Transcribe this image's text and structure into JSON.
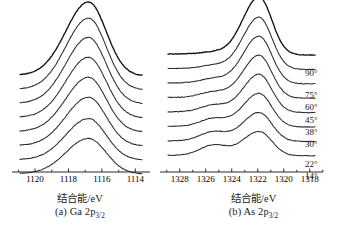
{
  "figure": {
    "type": "angle-resolved-xps-spectra",
    "panels": [
      {
        "id": "a",
        "label": "(a) Ga 2p",
        "label_sub": "3/2",
        "axis_unit": "结合能/eV",
        "ticks": [
          1120,
          1118,
          1116,
          1114
        ],
        "tick_labels": [
          "1120",
          "1118",
          "1116",
          "1114"
        ],
        "xlim": [
          1120.9,
          1113.6
        ],
        "peak_center": 1116.8,
        "peak_width": 1.15
      },
      {
        "id": "b",
        "label": "(b) As 2p",
        "label_sub": "3/2",
        "axis_unit": "结合能/eV",
        "ticks": [
          1328,
          1326,
          1324,
          1322,
          1320,
          1318
        ],
        "tick_labels": [
          "1328",
          "1326",
          "1324",
          "1322",
          "1320",
          "1318"
        ],
        "xlim": [
          1328.9,
          1317.6
        ],
        "peak_center": 1321.9,
        "peak_width": 1.05,
        "oxide_center": 1325.4,
        "oxide_width": 0.95
      }
    ],
    "angles": [
      "90°",
      "75°",
      "60°",
      "45°",
      "38°",
      "30°",
      "22°",
      "14°"
    ]
  },
  "chart_data": {
    "type": "line",
    "title": "",
    "xlabel": "结合能/eV",
    "ylabel": "强度 (任意单位)",
    "legend_position": "right",
    "legend_entries": [
      "90°",
      "75°",
      "60°",
      "45°",
      "38°",
      "30°",
      "22°",
      "14°"
    ],
    "grid": false,
    "note": "Stacked (offset) angle-resolved XPS spectra; x axis reversed (binding energy decreasing to the right).",
    "panels": [
      {
        "name": "(a) Ga 2p3/2",
        "xlim": [
          1120.9,
          1113.6
        ],
        "xticks": [
          1120,
          1118,
          1116,
          1114
        ],
        "series": [
          {
            "name": "90°",
            "peak_ev": 1116.8,
            "fwhm_ev": 2.7,
            "rel_height": 1.0,
            "oxide_rel_height": 0.0
          },
          {
            "name": "75°",
            "peak_ev": 1116.8,
            "fwhm_ev": 2.7,
            "rel_height": 0.97,
            "oxide_rel_height": 0.0
          },
          {
            "name": "60°",
            "peak_ev": 1116.8,
            "fwhm_ev": 2.7,
            "rel_height": 0.9,
            "oxide_rel_height": 0.0
          },
          {
            "name": "45°",
            "peak_ev": 1116.8,
            "fwhm_ev": 2.7,
            "rel_height": 0.82,
            "oxide_rel_height": 0.0
          },
          {
            "name": "38°",
            "peak_ev": 1116.8,
            "fwhm_ev": 2.7,
            "rel_height": 0.74,
            "oxide_rel_height": 0.0
          },
          {
            "name": "30°",
            "peak_ev": 1116.8,
            "fwhm_ev": 2.7,
            "rel_height": 0.66,
            "oxide_rel_height": 0.0
          },
          {
            "name": "22°",
            "peak_ev": 1116.8,
            "fwhm_ev": 2.7,
            "rel_height": 0.56,
            "oxide_rel_height": 0.0
          },
          {
            "name": "14°",
            "peak_ev": 1116.8,
            "fwhm_ev": 2.7,
            "rel_height": 0.48,
            "oxide_rel_height": 0.0
          }
        ]
      },
      {
        "name": "(b) As 2p3/2",
        "xlim": [
          1328.9,
          1317.6
        ],
        "xticks": [
          1328,
          1326,
          1324,
          1322,
          1320,
          1318
        ],
        "series": [
          {
            "name": "90°",
            "peak_ev": 1321.9,
            "fwhm_ev": 2.5,
            "rel_height": 1.0,
            "oxide_ev": 1325.4,
            "oxide_rel_height": 0.04
          },
          {
            "name": "75°",
            "peak_ev": 1321.9,
            "fwhm_ev": 2.5,
            "rel_height": 0.9,
            "oxide_ev": 1325.4,
            "oxide_rel_height": 0.06
          },
          {
            "name": "60°",
            "peak_ev": 1321.9,
            "fwhm_ev": 2.5,
            "rel_height": 0.82,
            "oxide_ev": 1325.4,
            "oxide_rel_height": 0.08
          },
          {
            "name": "45°",
            "peak_ev": 1321.9,
            "fwhm_ev": 2.5,
            "rel_height": 0.74,
            "oxide_ev": 1325.4,
            "oxide_rel_height": 0.1
          },
          {
            "name": "38°",
            "peak_ev": 1321.9,
            "fwhm_ev": 2.5,
            "rel_height": 0.66,
            "oxide_ev": 1325.4,
            "oxide_rel_height": 0.12
          },
          {
            "name": "30°",
            "peak_ev": 1321.9,
            "fwhm_ev": 2.5,
            "rel_height": 0.58,
            "oxide_ev": 1325.4,
            "oxide_rel_height": 0.14
          },
          {
            "name": "22°",
            "peak_ev": 1321.9,
            "fwhm_ev": 2.5,
            "rel_height": 0.5,
            "oxide_ev": 1325.4,
            "oxide_rel_height": 0.16
          },
          {
            "name": "14°",
            "peak_ev": 1321.9,
            "fwhm_ev": 2.5,
            "rel_height": 0.42,
            "oxide_ev": 1325.4,
            "oxide_rel_height": 0.18
          }
        ]
      }
    ]
  }
}
